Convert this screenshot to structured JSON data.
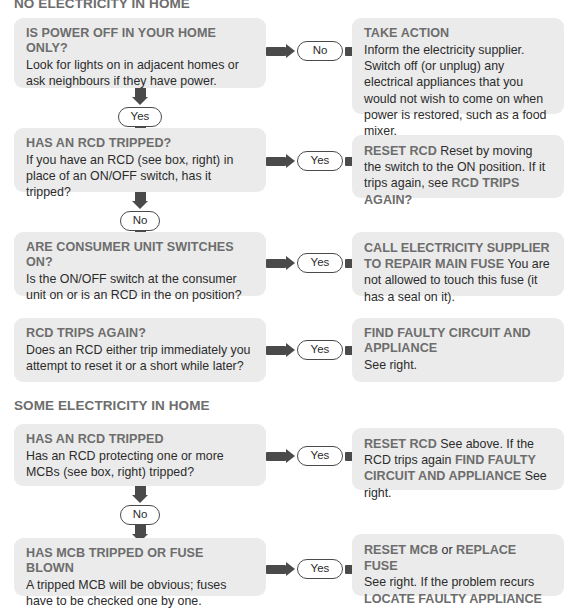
{
  "sections": [
    {
      "id": "no-electricity",
      "heading": "NO ELECTRICITY IN HOME"
    },
    {
      "id": "some-electricity",
      "heading": "SOME ELECTRICITY IN HOME"
    }
  ],
  "colors": {
    "box_background": "#ebebeb",
    "heading_gray": "#6d6d6d",
    "connector_dark": "#4a4a4a",
    "body_text": "#2b2b2b",
    "page_background": "#ffffff"
  },
  "rows": [
    {
      "question": {
        "title": "IS POWER OFF IN YOUR HOME ONLY?",
        "body": "Look for lights on in adjacent homes or ask neighbours if they have power."
      },
      "branch_label": "No",
      "answer": {
        "title": "TAKE ACTION",
        "body": "Inform the electricity supplier. Switch off (or unplug) any electrical appliances that you would not wish to come on when power is restored, such as a food mixer."
      },
      "down_label": "Yes"
    },
    {
      "question": {
        "title": "HAS AN RCD TRIPPED?",
        "body": "If you have an RCD (see box, right) in place of an ON/OFF switch, has it tripped?"
      },
      "branch_label": "Yes",
      "answer": {
        "lead": "RESET RCD",
        "mid": " Reset by moving the switch to the ON position. If it trips again, see ",
        "tail": "RCD TRIPS AGAIN?"
      },
      "down_label": "No"
    },
    {
      "question": {
        "title": "ARE CONSUMER UNIT SWITCHES ON?",
        "body": "Is the ON/OFF switch at the consumer unit on or is an RCD in the on position?"
      },
      "branch_label": "Yes",
      "answer": {
        "lead": "CALL ELECTRICITY SUPPLIER TO REPAIR MAIN FUSE",
        "mid": " You are not allowed to touch this fuse (it has a seal on it)."
      }
    },
    {
      "question": {
        "title": "RCD TRIPS AGAIN?",
        "body": "Does an RCD either trip immediately you attempt to reset it or a short while later?"
      },
      "branch_label": "Yes",
      "answer": {
        "title": "FIND FAULTY CIRCUIT AND APPLIANCE",
        "body": "See right."
      }
    },
    {
      "question": {
        "title": "HAS AN RCD TRIPPED",
        "body": "Has an RCD protecting one or more MCBs (see box, right) tripped?"
      },
      "branch_label": "Yes",
      "answer": {
        "lead": "RESET RCD",
        "mid": " See above. If the RCD trips again ",
        "tail": "FIND FAULTY CIRCUIT AND APPLIANCE",
        "tail2": " See right."
      },
      "down_label": "No"
    },
    {
      "question": {
        "title": "HAS MCB TRIPPED OR FUSE BLOWN",
        "body": "A tripped MCB will be obvious; fuses have to be checked one by one."
      },
      "branch_label": "Yes",
      "answer": {
        "lead": "RESET MCB",
        "mid": " or ",
        "tail": "REPLACE FUSE",
        "body": "See right. If the problem recurs",
        "tail2": "LOCATE FAULTY APPLIANCE"
      }
    }
  ]
}
